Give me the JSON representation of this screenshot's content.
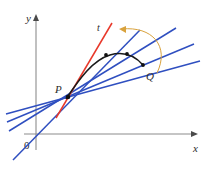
{
  "figure": {
    "background_color": "#ffffff"
  },
  "axes": {
    "x_label": "x",
    "y_label": "y",
    "origin_label": "0",
    "color": "#8c8c8c",
    "x_axis": {
      "x1": 24,
      "y1": 134,
      "x2": 198,
      "y2": 134
    },
    "y_axis": {
      "x1": 36,
      "y1": 150,
      "x2": 36,
      "y2": 16
    },
    "x_label_pos": {
      "x": 196,
      "y": 150
    },
    "y_label_pos": {
      "x": 27,
      "y": 22
    },
    "origin_label_pos": {
      "x": 26,
      "y": 148
    }
  },
  "points": [
    {
      "name": "P",
      "label": "P",
      "x": 68,
      "y": 97,
      "label_x": 56,
      "label_y": 93
    },
    {
      "name": "Q",
      "label": "Q",
      "x": 143,
      "y": 65,
      "label_x": 146,
      "label_y": 80
    },
    {
      "name": "Q1",
      "label": "",
      "x": 106,
      "y": 55,
      "label_x": 0,
      "label_y": 0
    },
    {
      "name": "Q2",
      "label": "",
      "x": 127,
      "y": 54,
      "label_x": 0,
      "label_y": 0
    }
  ],
  "curve": {
    "name": "function-curve",
    "color": "#1a1a1a",
    "width": 1.6,
    "path": "M 68 97 C 82 76, 94 60, 110 55 C 124 51, 134 56, 143 65"
  },
  "tangent_line": {
    "name": "tangent-line-t",
    "label": "t",
    "color": "#e8382a",
    "width": 1.4,
    "x1": 56,
    "y1": 117,
    "x2": 112,
    "y2": 24,
    "label_x": 98,
    "label_y": 30
  },
  "secant_lines": {
    "color": "#2f4fc0",
    "width": 1.4,
    "lines": [
      {
        "name": "secant-line-1",
        "x1": 13,
        "y1": 160,
        "x2": 140,
        "y2": 30
      },
      {
        "name": "secant-line-2",
        "x1": 9,
        "y1": 130,
        "x2": 176,
        "y2": 28
      },
      {
        "name": "secant-line-3",
        "x1": 7,
        "y1": 121,
        "x2": 192,
        "y2": 44
      },
      {
        "name": "secant-line-4",
        "x1": 6,
        "y1": 113,
        "x2": 198,
        "y2": 60
      }
    ]
  },
  "motion_arc": {
    "name": "q-approaches-p-arc",
    "color": "#d9a23c",
    "width": 1,
    "path": "M 158 72 C 168 44, 150 26, 124 28",
    "arrow_points": "124,28 131,24 131,32"
  },
  "colors": {
    "curve": "#1a1a1a",
    "tangent": "#e8382a",
    "secant": "#2f4fc0",
    "axis": "#8c8c8c",
    "arc": "#d9a23c",
    "label_text": "#2b2b2b"
  }
}
